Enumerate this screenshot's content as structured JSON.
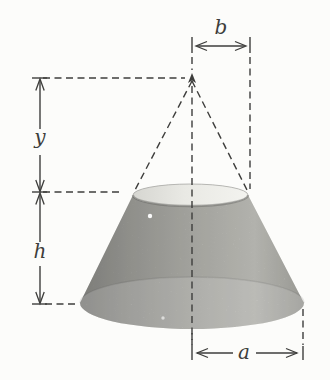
{
  "figure": {
    "type": "geometry-diagram",
    "labels": {
      "top_radius": "b",
      "apex_to_top_distance": "y",
      "frustum_height": "h",
      "base_radius": "a"
    },
    "colors": {
      "background": "#fcfcfa",
      "line": "#3e3e3c",
      "body_left": "#8e8e8a",
      "body_midleft": "#a3a39e",
      "body_mid": "#b9b9b3",
      "body_midright": "#cbcbc5",
      "body_right": "#aeaea8",
      "top_face_left": "#d6d6d1",
      "top_face_mid": "#e9e9e4",
      "top_face_right": "#f3f3ef"
    }
  }
}
